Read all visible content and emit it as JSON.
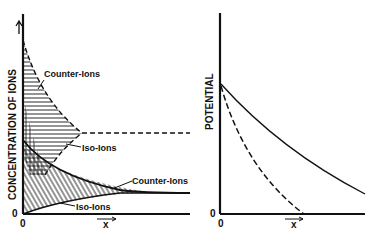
{
  "left_panel": {
    "ylabel": "CONCENTRATION OF IONS",
    "xlabel": "x",
    "origin_y": "0",
    "origin_x": "0",
    "annotations": {
      "counter_ions_top": "Counter-Ions",
      "iso_ions_top": "Iso-Ions",
      "counter_ions_bottom": "Counter-Ions",
      "iso_ions_bottom": "Iso-Ions"
    }
  },
  "right_panel": {
    "ylabel": "POTENTIAL",
    "xlabel": "x",
    "origin_y": "0",
    "origin_x": "0"
  },
  "colors": {
    "ink": "#111111",
    "background": "#ffffff"
  }
}
